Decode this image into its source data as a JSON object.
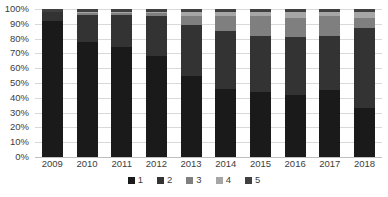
{
  "chart_data": {
    "type": "bar",
    "stacked": true,
    "normalized": true,
    "title": "",
    "subtitle": "",
    "xlabel": "",
    "ylabel": "",
    "ylim": [
      0,
      100
    ],
    "grid": true,
    "legend_position": "bottom",
    "categories": [
      "2009",
      "2010",
      "2011",
      "2012",
      "2013",
      "2014",
      "2015",
      "2016",
      "2017",
      "2018"
    ],
    "ytick_labels": [
      "0%",
      "10%",
      "20%",
      "30%",
      "40%",
      "50%",
      "60%",
      "70%",
      "80%",
      "90%",
      "100%"
    ],
    "ytick_values": [
      0,
      10,
      20,
      30,
      40,
      50,
      60,
      70,
      80,
      90,
      100
    ],
    "series": [
      {
        "name": "1",
        "color": "#1a1a1a",
        "values": [
          92,
          78,
          74,
          68,
          55,
          46,
          44,
          42,
          45,
          33
        ]
      },
      {
        "name": "2",
        "color": "#333333",
        "values": [
          6,
          18,
          22,
          27,
          34,
          39,
          38,
          39,
          37,
          54
        ]
      },
      {
        "name": "3",
        "color": "#7f7f7f",
        "values": [
          0,
          1,
          1,
          2,
          6,
          10,
          13,
          13,
          13,
          7
        ]
      },
      {
        "name": "4",
        "color": "#a6a6a6",
        "values": [
          0,
          1,
          1,
          1,
          3,
          3,
          3,
          4,
          3,
          4
        ]
      },
      {
        "name": "5",
        "color": "#404040",
        "values": [
          2,
          2,
          2,
          2,
          2,
          2,
          2,
          2,
          2,
          2
        ]
      }
    ]
  },
  "legend": {
    "items": [
      {
        "label": "1",
        "color": "#1a1a1a"
      },
      {
        "label": "2",
        "color": "#333333"
      },
      {
        "label": "3",
        "color": "#7f7f7f"
      },
      {
        "label": "4",
        "color": "#a6a6a6"
      },
      {
        "label": "5",
        "color": "#404040"
      }
    ]
  },
  "footnote": {
    "text": ""
  }
}
